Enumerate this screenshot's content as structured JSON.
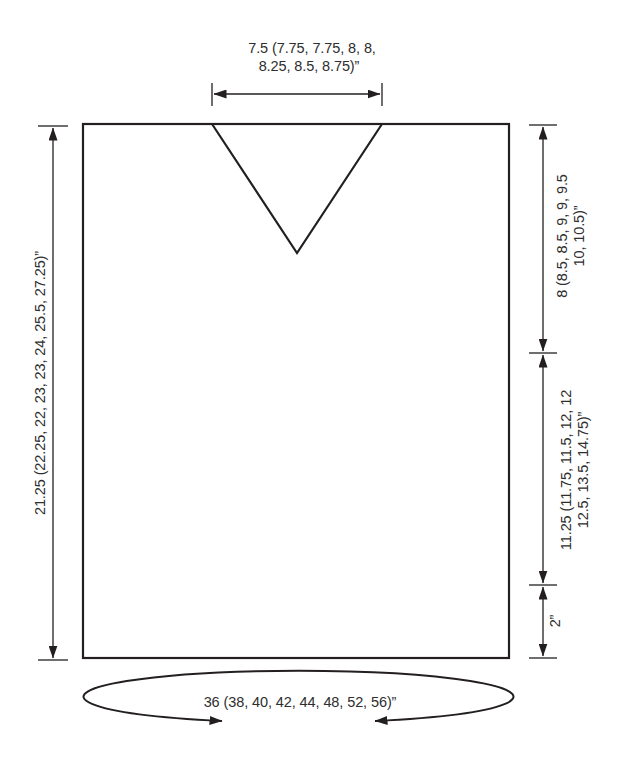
{
  "schematic": {
    "measurements": {
      "neck_width": {
        "line1": "7.5 (7.75, 7.75, 8, 8,",
        "line2": "8.25, 8.5, 8.75)”"
      },
      "body_length": "21.25 (22.25, 22, 23, 23, 24, 25.5, 27.25)”",
      "upper_right_depth": {
        "line1": "8 (8.5, 8.5, 9, 9, 9.5",
        "line2": "10, 10.5)”"
      },
      "middle_right_length": {
        "line1": "11.25 (11.75, 11.5, 12, 12",
        "line2": "12.5, 13.5, 14.75)”"
      },
      "lower_edge": "2”",
      "circumference": "36 (38, 40, 42, 44, 48, 52, 56)”"
    },
    "colors": {
      "line": "#231f20",
      "text": "#2e2e2e",
      "background": "#ffffff"
    }
  }
}
